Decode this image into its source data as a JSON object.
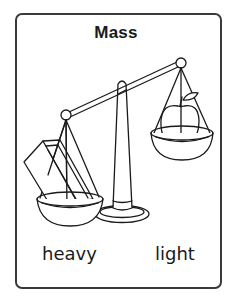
{
  "card": {
    "title": "Mass",
    "left_label": "heavy",
    "right_label": "light"
  },
  "illustration": {
    "subject": "balance-scale",
    "left_pan_item": "block",
    "right_pan_item": "apple",
    "heavier_side": "left"
  },
  "colors": {
    "line": "#1a1a1a",
    "background": "#ffffff",
    "border": "#3a3a3a"
  }
}
